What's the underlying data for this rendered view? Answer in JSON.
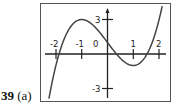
{
  "problem": {
    "number": "39",
    "part": "(a)"
  },
  "chart_data": {
    "type": "line",
    "title": "",
    "xlabel": "",
    "ylabel": "",
    "function": "y = x^3 - 3x + 1",
    "x_ticks": [
      "-2",
      "-1",
      "0",
      "1",
      "2"
    ],
    "y_ticks": [
      "3",
      "-3"
    ],
    "xlim": [
      -2.3,
      2.4
    ],
    "ylim": [
      -4,
      4.2
    ],
    "grid": false,
    "series": [
      {
        "name": "curve",
        "x": [
          -2.27,
          -2,
          -1.5,
          -1,
          -0.5,
          0,
          0.5,
          1,
          1.5,
          2,
          2.12
        ],
        "y": [
          -3.9,
          -1,
          2.125,
          3,
          2.375,
          1,
          -0.375,
          -1,
          -0.125,
          3,
          4.2
        ]
      }
    ],
    "key_points": {
      "local_max": [
        -1,
        3
      ],
      "local_min": [
        1,
        -1
      ],
      "y_intercept": [
        0,
        1
      ]
    }
  },
  "labels": {
    "xm2": "-2",
    "xm1": "-1",
    "x0": "0",
    "x1": "1",
    "x2": "2",
    "y3": "3",
    "ym3": "-3"
  }
}
